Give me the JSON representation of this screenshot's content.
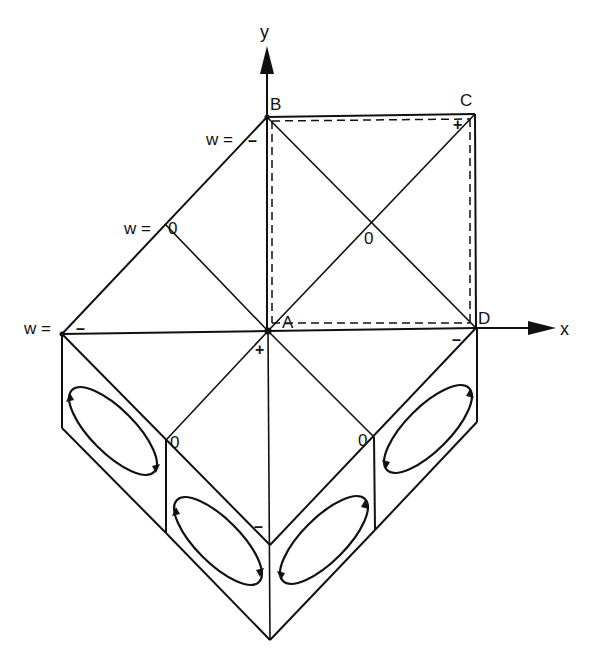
{
  "diagram": {
    "title": "",
    "axes": {
      "x_label": "x",
      "y_label": "y"
    },
    "points": {
      "A": "A",
      "B": "B",
      "C": "C",
      "D": "D"
    },
    "w_labels": {
      "w_top": "w =",
      "w_mid": "w =",
      "w_left": "w ="
    },
    "signs": {
      "at_B": "–",
      "at_mid_left": "0",
      "at_left": "–",
      "at_C": "+",
      "center_O": "0",
      "at_A_below": "+",
      "at_D_below": "–",
      "lower_left_zero": "0",
      "lower_right_zero": "0",
      "bottom_mid_minus": "–"
    },
    "faces": [
      {
        "name": "left-outer-face",
        "loop": "circulation loop"
      },
      {
        "name": "left-inner-face",
        "loop": "circulation loop"
      },
      {
        "name": "right-inner-face",
        "loop": "circulation loop"
      },
      {
        "name": "right-outer-face",
        "loop": "circulation loop"
      }
    ]
  }
}
